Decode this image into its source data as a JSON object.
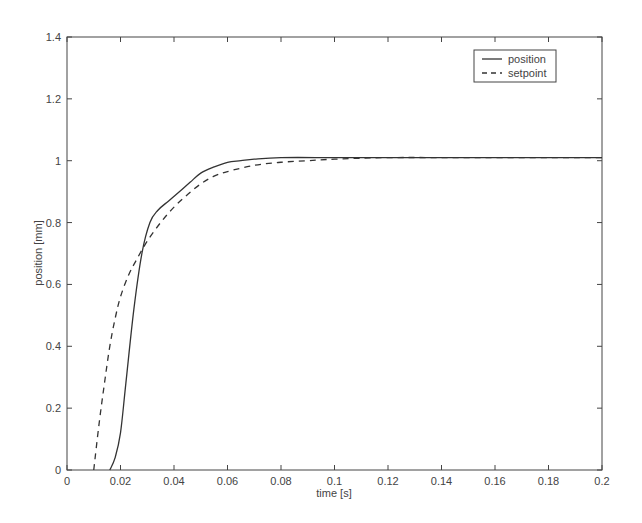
{
  "chart_data": {
    "type": "line",
    "title": "",
    "xlabel": "time [s]",
    "ylabel": "position [mm]",
    "xlim": [
      0,
      0.2
    ],
    "ylim": [
      0,
      1.4
    ],
    "xticks": [
      "0",
      "0.02",
      "0.04",
      "0.06",
      "0.08",
      "0.1",
      "0.12",
      "0.14",
      "0.16",
      "0.18",
      "0.2"
    ],
    "yticks": [
      "0",
      "0.2",
      "0.4",
      "0.6",
      "0.8",
      "1",
      "1.2",
      "1.4"
    ],
    "grid": false,
    "legend_position": "upper right",
    "series": [
      {
        "name": "position",
        "style": "solid",
        "x": [
          0.016,
          0.018,
          0.02,
          0.022,
          0.025,
          0.028,
          0.031,
          0.034,
          0.038,
          0.042,
          0.046,
          0.05,
          0.055,
          0.06,
          0.065,
          0.07,
          0.08,
          0.1,
          0.12,
          0.15,
          0.2
        ],
        "y": [
          0.0,
          0.04,
          0.12,
          0.28,
          0.52,
          0.7,
          0.8,
          0.84,
          0.87,
          0.9,
          0.93,
          0.96,
          0.98,
          0.995,
          1.0,
          1.005,
          1.01,
          1.01,
          1.01,
          1.01,
          1.01
        ]
      },
      {
        "name": "setpoint",
        "style": "dashed",
        "x": [
          0.01,
          0.012,
          0.014,
          0.016,
          0.018,
          0.02,
          0.023,
          0.026,
          0.03,
          0.035,
          0.04,
          0.045,
          0.05,
          0.055,
          0.06,
          0.07,
          0.08,
          0.09,
          0.1,
          0.12,
          0.15,
          0.2
        ],
        "y": [
          0.0,
          0.15,
          0.28,
          0.4,
          0.49,
          0.56,
          0.63,
          0.68,
          0.74,
          0.8,
          0.85,
          0.89,
          0.925,
          0.95,
          0.965,
          0.985,
          0.995,
          1.0,
          1.005,
          1.01,
          1.01,
          1.01
        ]
      }
    ]
  },
  "legend": {
    "items": [
      {
        "label": "position",
        "style": "solid"
      },
      {
        "label": "setpoint",
        "style": "dashed"
      }
    ]
  },
  "colors": {
    "line": "#333333",
    "axis": "#444444",
    "background": "#ffffff"
  }
}
